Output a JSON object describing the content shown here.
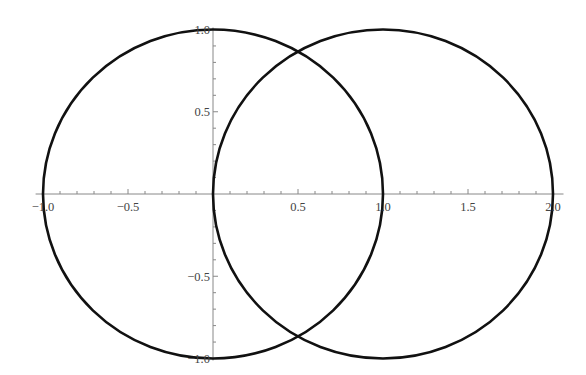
{
  "chart_data": {
    "type": "line",
    "title": "",
    "xlabel": "",
    "ylabel": "",
    "xlim": [
      -1.02,
      2.05
    ],
    "ylim": [
      -1.0,
      1.0
    ],
    "grid": false,
    "legend": null,
    "x_ticks": [
      -1.0,
      -0.5,
      0.5,
      1.0,
      1.5,
      2.0
    ],
    "x_tick_labels": [
      "−1.0",
      "−0.5",
      "0.5",
      "1.0",
      "1.5",
      "2.0"
    ],
    "y_ticks": [
      1.0,
      0.5,
      -0.5,
      -1.0
    ],
    "y_tick_labels": [
      "1.0",
      "0.5",
      "−0.5",
      "−1.0"
    ],
    "series": [
      {
        "name": "circle-1",
        "shape": "circle",
        "center": [
          0,
          0
        ],
        "radius": 1,
        "equation": "x^2 + y^2 = 1",
        "color": "#111111"
      },
      {
        "name": "circle-2",
        "shape": "circle",
        "center": [
          1,
          0
        ],
        "radius": 1,
        "equation": "(x-1)^2 + y^2 = 1",
        "color": "#111111"
      }
    ],
    "annotations": [],
    "intersections": [
      [
        0.5,
        0.866
      ],
      [
        0.5,
        -0.866
      ]
    ]
  },
  "style": {
    "axis_color": "#888888",
    "curve_color": "#111111",
    "label_color": "#444444",
    "background": "#ffffff"
  }
}
